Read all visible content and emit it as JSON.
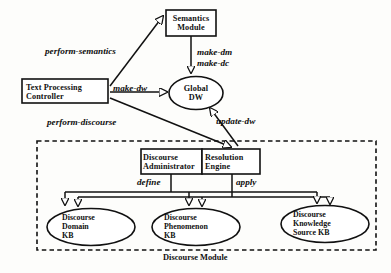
{
  "diagram": {
    "caption": "Discourse Module",
    "colors": {
      "stroke": "#111111",
      "background": "#fdfdfb",
      "text": "#111111"
    },
    "nodes": {
      "semantics_module": {
        "label": "Semantics\nModule",
        "shape": "rect"
      },
      "text_processing_controller": {
        "label": "Text Processing\nController",
        "shape": "rect"
      },
      "global_dw": {
        "label": "Global\nDW",
        "shape": "ellipse"
      },
      "discourse_administrator": {
        "label": "Discourse\nAdministrator",
        "shape": "rect"
      },
      "resolution_engine": {
        "label": "Resolution\nEngine",
        "shape": "rect"
      },
      "discourse_domain_kb": {
        "label": "Discourse\nDomain\nKB",
        "shape": "ellipse"
      },
      "discourse_phenomenon_kb": {
        "label": "Discourse\nPhenomenon\nKB",
        "shape": "ellipse"
      },
      "discourse_knowledge_source_kb": {
        "label": "Discourse\nKnowledge\nSource KB",
        "shape": "ellipse"
      }
    },
    "edges": {
      "perform_semantics": {
        "label": "perform-semantics",
        "from": "text_processing_controller",
        "to": "semantics_module"
      },
      "make_dm": {
        "label": "make-dm",
        "from": "semantics_module",
        "to": "global_dw"
      },
      "make_dc": {
        "label": "make-dc",
        "from": "semantics_module",
        "to": "global_dw"
      },
      "make_dw": {
        "label": "make-dw",
        "from": "text_processing_controller",
        "to": "global_dw"
      },
      "perform_discourse": {
        "label": "perform-discourse",
        "from": "text_processing_controller",
        "to": "resolution_engine"
      },
      "update_dw": {
        "label": "update-dw",
        "from": "resolution_engine",
        "to": "global_dw"
      },
      "define": {
        "label": "define",
        "from": "discourse_administrator",
        "to": "knowledge_bases"
      },
      "apply": {
        "label": "apply",
        "from": "resolution_engine",
        "to": "knowledge_bases"
      }
    }
  }
}
